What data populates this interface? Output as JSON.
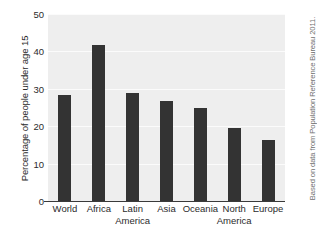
{
  "chart_data": {
    "type": "bar",
    "title": "",
    "subtitle": "",
    "xlabel": "",
    "ylabel": "Percentage of people under age 15",
    "categories": [
      "World",
      "Africa",
      "Latin America",
      "Asia",
      "Oceania",
      "North America",
      "Europe"
    ],
    "category_lines": [
      [
        "World",
        ""
      ],
      [
        "Africa",
        ""
      ],
      [
        "Latin",
        "America"
      ],
      [
        "Asia",
        ""
      ],
      [
        "Oceania",
        ""
      ],
      [
        "North",
        "America"
      ],
      [
        "Europe",
        ""
      ]
    ],
    "values": [
      28.3,
      41.6,
      28.8,
      26.7,
      24.8,
      19.5,
      16.3
    ],
    "ylim": [
      0,
      50
    ],
    "yticks": [
      50,
      40,
      30,
      20,
      10,
      0
    ],
    "ytick_labels": [
      "50",
      "40",
      "30",
      "20",
      "10",
      "0"
    ],
    "grid": true,
    "legend": false,
    "legend_position": "none",
    "bar_color": "#333333",
    "plot_background": "#eeeeee",
    "annotation": "Based on data from Population Reference Bureau 2011."
  },
  "annotation_text": "Based on data from Population Reference Bureau 2011."
}
